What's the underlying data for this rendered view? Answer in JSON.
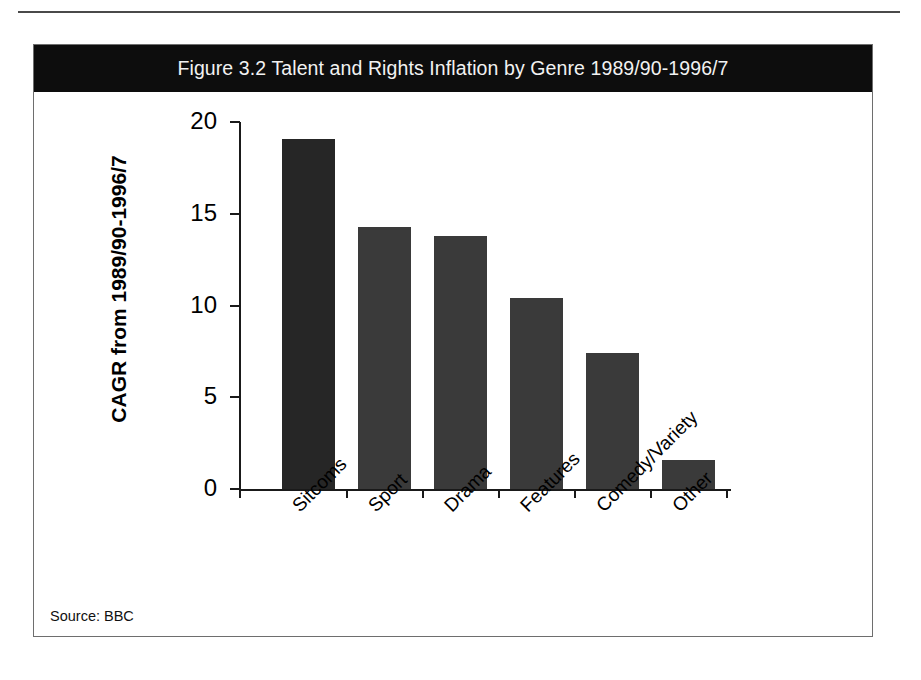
{
  "figure": {
    "title": "Figure 3.2 Talent and Rights Inflation by Genre 1989/90-1996/7",
    "source_note": "Source: BBC"
  },
  "colors": {
    "title_band": "#0d0d0d",
    "title_text": "#f2f2f2",
    "bar_default": "#3a3a3a",
    "bar_highlight": "#262626",
    "axis": "#1a1a1a",
    "frame": "#6e6e6e"
  },
  "chart_data": {
    "type": "bar",
    "title": "Figure 3.2 Talent and Rights Inflation by Genre 1989/90-1996/7",
    "xlabel": "",
    "ylabel": "CAGR from 1989/90-1996/7",
    "categories": [
      "Sitcoms",
      "Sport",
      "Drama",
      "Features",
      "Comedy/Variety",
      "Other"
    ],
    "values": [
      19.1,
      14.3,
      13.8,
      10.4,
      7.4,
      1.6
    ],
    "ylim": [
      0,
      20
    ],
    "yticks": [
      0,
      5,
      10,
      15,
      20
    ],
    "ytick_labels": [
      "0",
      "5",
      "10",
      "15",
      "20"
    ],
    "grid": false,
    "legend": false
  }
}
